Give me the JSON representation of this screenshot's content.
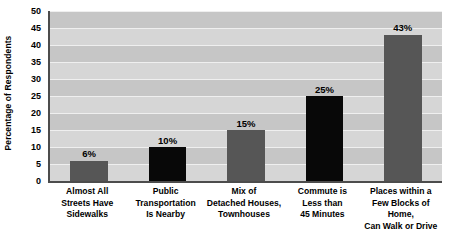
{
  "chart_data": {
    "type": "bar",
    "title": "",
    "xlabel": "",
    "ylabel": "Percentage of Respondents",
    "ylim": [
      0,
      50
    ],
    "ytick_step": 5,
    "yticks": [
      50,
      45,
      40,
      35,
      30,
      25,
      20,
      15,
      10,
      5,
      0
    ],
    "ytick_labels": [
      "50",
      "45",
      "40",
      "35",
      "30",
      "25",
      "20",
      "15",
      "10",
      "5",
      "0"
    ],
    "grid": true,
    "legend": "none",
    "categories": [
      "Almost All\nStreets Have\nSidewalks",
      "Public\nTransportation\nIs Nearby",
      "Mix of\nDetached Houses,\nTownhouses",
      "Commute is\nLess than\n45 Minutes",
      "Places within a\nFew Blocks of Home,\nCan Walk or Drive"
    ],
    "category_lines": [
      [
        "Almost All",
        "Streets Have",
        "Sidewalks"
      ],
      [
        "Public",
        "Transportation",
        "Is Nearby"
      ],
      [
        "Mix of",
        "Detached Houses,",
        "Townhouses"
      ],
      [
        "Commute is",
        "Less than",
        "45 Minutes"
      ],
      [
        "Places within a",
        "Few Blocks of Home,",
        "Can Walk or Drive"
      ]
    ],
    "values": [
      6,
      10,
      15,
      25,
      43
    ],
    "data_labels": [
      "6%",
      "10%",
      "15%",
      "25%",
      "43%"
    ],
    "bar_colors": [
      "#565656",
      "#080808",
      "#565656",
      "#080808",
      "#565656"
    ]
  },
  "colors": {
    "plot_background": "#cfcfcf",
    "band_light": "#d6d6d6",
    "band_dark": "#c6c6c6",
    "gridline": "#efefef",
    "axis_line": "#4c4c4c",
    "bar_gray": "#565656",
    "bar_black": "#080808",
    "text": "#000000",
    "page_background": "#ffffff"
  }
}
